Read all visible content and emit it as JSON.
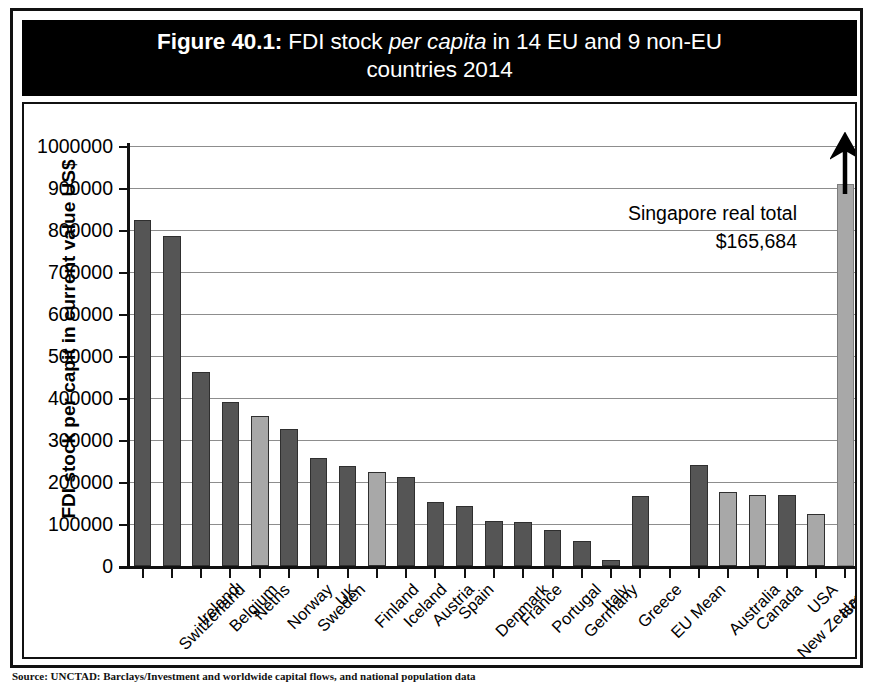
{
  "figure": {
    "number": "Figure 40.1:",
    "title_part1": " FDI stock ",
    "title_italic": "per capita",
    "title_part2": " in 14 EU and 9 non-EU",
    "title_line2": "countries 2014"
  },
  "annotation": {
    "line1": "Singapore real total",
    "line2": "$165,684"
  },
  "source": {
    "text": "Source: UNCTAD: Barclays/Investment and worldwide capital flows, and national population data"
  },
  "colors": {
    "bar_dark": "#555555",
    "bar_light": "#a8a8a8",
    "gridline": "#8d8d8d",
    "axis": "#111111",
    "banner_bg": "#000000",
    "banner_text": "#ffffff"
  },
  "chart_data": {
    "type": "bar",
    "title": "Figure 40.1: FDI stock per capita in 14 EU and 9 non-EU countries 2014",
    "xlabel": "",
    "ylabel": "FDI stock per capit in current value US$",
    "ylim": [
      0,
      1000000
    ],
    "ytick_labels": [
      "0",
      "100000",
      "200000",
      "300000",
      "400000",
      "500000",
      "600000",
      "700000",
      "800000",
      "900000",
      "1000000"
    ],
    "ytick_values": [
      0,
      100000,
      200000,
      300000,
      400000,
      500000,
      600000,
      700000,
      800000,
      900000,
      1000000
    ],
    "grid": true,
    "legend": "none",
    "categories": [
      "Switzerland",
      "Ireland",
      "Belgium",
      "Neths",
      "Norway",
      "Sweden",
      "UK",
      "Finland",
      "Iceland",
      "Austria",
      "Spain",
      "Denmark",
      "France",
      "Portugal",
      "Germany",
      "Italy",
      "Greece",
      "EU Mean",
      "",
      "Australia",
      "Canada",
      "New Zealand",
      "USA",
      "Israel",
      "Singapore"
    ],
    "values": [
      824000,
      785000,
      463000,
      390000,
      357000,
      327000,
      256000,
      238000,
      224000,
      212000,
      152000,
      143000,
      108000,
      104000,
      85000,
      59000,
      14000,
      166000,
      null,
      240000,
      176000,
      169000,
      168000,
      124000,
      910000
    ],
    "bar_shades": [
      "dark",
      "dark",
      "dark",
      "dark",
      "light",
      "dark",
      "dark",
      "dark",
      "light",
      "dark",
      "dark",
      "dark",
      "dark",
      "dark",
      "dark",
      "dark",
      "dark",
      "dark",
      "none",
      "dark",
      "light",
      "light",
      "dark",
      "light",
      "light"
    ],
    "truncated_bars": [
      "Singapore"
    ],
    "annotations": [
      {
        "text": "Singapore real total $165,684",
        "target": "Singapore"
      }
    ]
  }
}
